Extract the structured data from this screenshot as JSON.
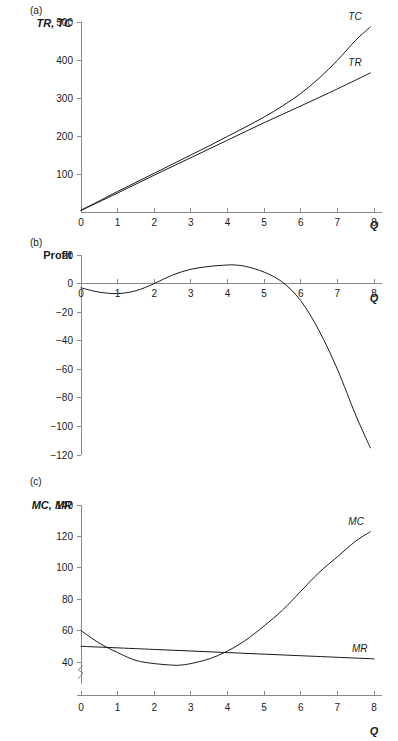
{
  "figure": {
    "panels": [
      {
        "tag": "(a)",
        "ylabel": "TR, TC",
        "xlabel": "Q"
      },
      {
        "tag": "(b)",
        "ylabel": "Profit",
        "xlabel": "Q"
      },
      {
        "tag": "(c)",
        "ylabel": "MC, MR",
        "xlabel": "Q"
      }
    ]
  },
  "chart_data": [
    {
      "type": "line",
      "title": "(a)",
      "xlabel": "Q",
      "ylabel": "TR, TC",
      "xlim": [
        0,
        8
      ],
      "ylim": [
        0,
        500
      ],
      "xticks": [
        0,
        1,
        2,
        3,
        4,
        5,
        6,
        7,
        8
      ],
      "yticks": [
        100,
        200,
        300,
        400,
        500
      ],
      "grid": false,
      "legend_position": "inline-end-of-curve",
      "series": [
        {
          "name": "TC",
          "label": "TC",
          "x": [
            0,
            0.5,
            1,
            1.5,
            2,
            2.5,
            3,
            3.5,
            4,
            4.5,
            5,
            5.5,
            6,
            6.5,
            7,
            7.5,
            7.9
          ],
          "y": [
            5,
            29,
            54,
            78,
            102,
            126,
            150,
            174,
            199,
            224,
            250,
            279,
            312,
            352,
            399,
            452,
            487
          ]
        },
        {
          "name": "TR",
          "label": "TR",
          "x": [
            0,
            1,
            2,
            3,
            4,
            5,
            6,
            7,
            7.9
          ],
          "y": [
            4,
            50,
            97,
            143,
            189,
            235,
            279,
            324,
            366
          ]
        }
      ]
    },
    {
      "type": "line",
      "title": "(b)",
      "xlabel": "Q",
      "ylabel": "Profit",
      "xlim": [
        0,
        8
      ],
      "ylim": [
        -120,
        20
      ],
      "xticks": [
        0,
        1,
        2,
        3,
        4,
        5,
        6,
        7,
        8
      ],
      "yticks": [
        20,
        0,
        -20,
        -40,
        -60,
        -80,
        -100,
        -120
      ],
      "grid": false,
      "legend_position": "none",
      "series": [
        {
          "name": "Profit",
          "label": "",
          "x": [
            0,
            0.5,
            1,
            1.5,
            2,
            2.5,
            3,
            3.5,
            4,
            4.2,
            4.5,
            5,
            5.5,
            6,
            6.5,
            7,
            7.5,
            7.9
          ],
          "y": [
            -3,
            -6,
            -7,
            -5,
            0,
            6,
            10,
            12,
            13,
            13,
            12,
            8,
            1,
            -12,
            -33,
            -60,
            -92,
            -115
          ]
        }
      ]
    },
    {
      "type": "line",
      "title": "(c)",
      "xlabel": "Q",
      "ylabel": "MC, MR",
      "xlim": [
        0,
        8
      ],
      "ylim": [
        40,
        140
      ],
      "yaxis_break": true,
      "yaxis_break_label": "0",
      "xticks": [
        0,
        1,
        2,
        3,
        4,
        5,
        6,
        7,
        8
      ],
      "yticks": [
        40,
        60,
        80,
        100,
        120,
        140
      ],
      "grid": false,
      "legend_position": "inline-end-of-curve",
      "series": [
        {
          "name": "MC",
          "label": "MC",
          "x": [
            0,
            0.5,
            1,
            1.5,
            2,
            2.5,
            2.7,
            3,
            3.5,
            4,
            4.5,
            5,
            5.5,
            6,
            6.5,
            7,
            7.5,
            7.9
          ],
          "y": [
            60,
            52,
            46,
            41,
            39,
            38,
            38,
            39,
            42,
            47,
            54,
            63,
            73,
            85,
            97,
            107,
            117,
            123
          ]
        },
        {
          "name": "MR",
          "label": "MR",
          "x": [
            0,
            2,
            4,
            6,
            8
          ],
          "y": [
            50,
            48,
            46,
            44,
            42
          ]
        }
      ]
    }
  ]
}
